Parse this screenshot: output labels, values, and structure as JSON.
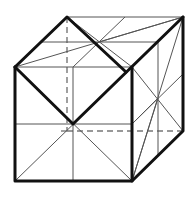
{
  "diagram": {
    "type": "cube-line-drawing",
    "colors": {
      "background": "#ffffff",
      "thick_line": "#111111",
      "thin_line": "#555555",
      "hidden_line": "#777777"
    },
    "vertices": {
      "front_top_left": [
        15,
        67
      ],
      "front_top_right": [
        132,
        67
      ],
      "front_bottom_left": [
        15,
        181
      ],
      "front_bottom_right": [
        132,
        181
      ],
      "back_top_left": [
        67,
        17
      ],
      "back_top_right": [
        183,
        17
      ],
      "back_bottom_left": [
        67,
        131
      ],
      "back_bottom_right": [
        183,
        131
      ],
      "front_center": [
        73,
        124
      ],
      "top_center": [
        99,
        42
      ],
      "right_center": [
        158,
        98
      ]
    },
    "labels": []
  }
}
